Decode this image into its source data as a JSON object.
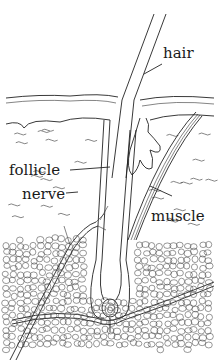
{
  "diagram": {
    "labels": {
      "hair": "hair",
      "follicle": "follicle",
      "nerve": "nerve",
      "muscle": "muscle"
    },
    "colors": {
      "ink": "#222222",
      "background": "#ffffff"
    }
  }
}
